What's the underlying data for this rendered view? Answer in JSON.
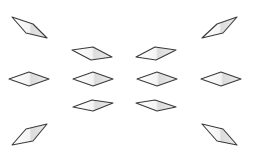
{
  "diagram": {
    "title": "",
    "colors": {
      "background": "#ffffff",
      "stroke": "#3a3a3a",
      "fill_light": "#ffffff",
      "fill_shade": "#d8d8d8"
    },
    "shapes": [
      {
        "id": "top-left",
        "kind": "rhombus"
      },
      {
        "id": "top-right",
        "kind": "rhombus"
      },
      {
        "id": "upper-inner-left",
        "kind": "rhombus"
      },
      {
        "id": "upper-inner-right",
        "kind": "rhombus"
      },
      {
        "id": "middle-1",
        "kind": "rhombus"
      },
      {
        "id": "middle-2",
        "kind": "rhombus"
      },
      {
        "id": "middle-3",
        "kind": "rhombus"
      },
      {
        "id": "middle-4",
        "kind": "rhombus"
      },
      {
        "id": "lower-inner-left",
        "kind": "rhombus"
      },
      {
        "id": "lower-inner-right",
        "kind": "rhombus"
      },
      {
        "id": "bottom-left",
        "kind": "rhombus"
      },
      {
        "id": "bottom-right",
        "kind": "rhombus"
      }
    ]
  }
}
